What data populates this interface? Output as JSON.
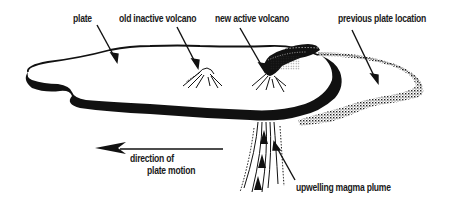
{
  "diagram": {
    "labels": {
      "plate": "plate",
      "old_volcano": "old inactive volcano",
      "new_volcano": "new active volcano",
      "previous_location": "previous plate location",
      "direction_line1": "direction of",
      "direction_line2": "plate motion",
      "plume": "upwelling magma plume"
    },
    "colors": {
      "ink": "#111111",
      "background": "#ffffff"
    }
  }
}
